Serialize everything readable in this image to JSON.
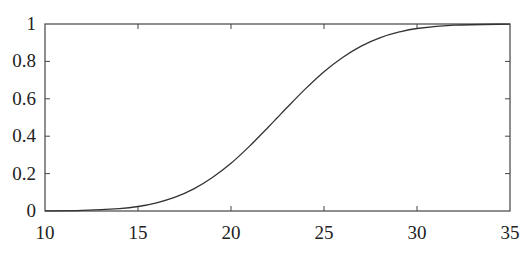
{
  "chart_data": {
    "type": "line",
    "title": "",
    "xlabel": "",
    "ylabel": "",
    "xlim": [
      10,
      35
    ],
    "ylim": [
      0,
      1
    ],
    "grid": false,
    "legend": null,
    "xticks": [
      10,
      15,
      20,
      25,
      30,
      35
    ],
    "yticks": [
      0,
      0.2,
      0.4,
      0.6,
      0.8,
      1
    ],
    "xtick_labels": [
      "10",
      "15",
      "20",
      "25",
      "30",
      "35"
    ],
    "ytick_labels": [
      "0",
      "0.2",
      "0.4",
      "0.6",
      "0.8",
      "1"
    ],
    "series": [
      {
        "name": "cumulative curve",
        "color": "#333333",
        "x": [
          10,
          12,
          14,
          15,
          16,
          17,
          18,
          19,
          20,
          21,
          22,
          22.5,
          23,
          24,
          25,
          26,
          27,
          28,
          29,
          30,
          32,
          35
        ],
        "y": [
          0.0005,
          0.003,
          0.013,
          0.024,
          0.044,
          0.074,
          0.118,
          0.179,
          0.255,
          0.347,
          0.448,
          0.5,
          0.552,
          0.653,
          0.745,
          0.821,
          0.882,
          0.926,
          0.956,
          0.976,
          0.994,
          0.9995
        ]
      }
    ]
  }
}
